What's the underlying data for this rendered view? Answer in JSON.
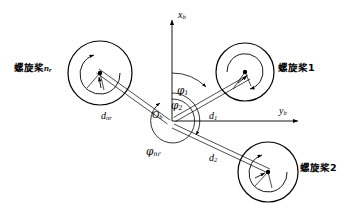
{
  "figure": {
    "type": "multirotor-geometry-diagram",
    "background": "#ffffff",
    "stroke_color": "#000000",
    "width": 356,
    "height": 216
  },
  "axes": {
    "x_axis": {
      "label_main": "x",
      "label_sub": "b",
      "direction": "up",
      "origin_px": [
        172,
        121
      ],
      "tip_px": [
        172,
        18
      ]
    },
    "y_axis": {
      "label_main": "y",
      "label_sub": "b",
      "direction": "right",
      "origin_px": [
        172,
        121
      ],
      "tip_px": [
        300,
        121
      ]
    },
    "origin": {
      "label_main": "O",
      "label_sub": "b"
    }
  },
  "rotors": [
    {
      "id": "rotor-1",
      "label_cjk": "螺旋桨",
      "label_index": "1",
      "center_px": [
        245,
        72
      ],
      "outer_radius": 29,
      "inner_radius": 18,
      "spin": "ccw",
      "arm_label_main": "d",
      "arm_label_sub": "1"
    },
    {
      "id": "rotor-2",
      "label_cjk": "螺旋桨",
      "label_index": "2",
      "center_px": [
        268,
        172
      ],
      "outer_radius": 30,
      "inner_radius": 19,
      "spin": "cw",
      "arm_label_main": "d",
      "arm_label_sub": "2"
    },
    {
      "id": "rotor-nr",
      "label_cjk": "螺旋桨",
      "label_index": "n",
      "label_index_sub": "r",
      "center_px": [
        100,
        73
      ],
      "outer_radius": 32,
      "inner_radius": 20,
      "spin": "cw",
      "arm_label_main": "d",
      "arm_label_sub": "nr"
    }
  ],
  "angles": [
    {
      "id": "phi-1",
      "symbol": "φ",
      "sub": "1",
      "from_axis": "x_b",
      "to": "rotor-1-arm"
    },
    {
      "id": "phi-2",
      "symbol": "φ",
      "sub": "2",
      "from_axis": "x_b",
      "to": "rotor-2-arm"
    },
    {
      "id": "phi-nr",
      "symbol": "φ",
      "sub": "nr",
      "from_axis": "x_b",
      "to": "rotor-nr-arm"
    }
  ],
  "labels": {
    "rotor1_text": "螺旋桨1",
    "rotor2_text": "螺旋桨2",
    "rotornr_cjk": "螺旋桨",
    "rotornr_n": "n",
    "rotornr_r": "r",
    "x_axis_main": "x",
    "x_axis_sub": "b",
    "y_axis_main": "y",
    "y_axis_sub": "b",
    "origin_main": "O",
    "origin_sub": "b",
    "d1_main": "d",
    "d1_sub": "1",
    "d2_main": "d",
    "d2_sub": "2",
    "dnr_main": "d",
    "dnr_sub": "nr",
    "phi1_main": "φ",
    "phi1_sub": "1",
    "phi2_main": "φ",
    "phi2_sub": "2",
    "phinr_main": "φ",
    "phinr_sub": "nr"
  }
}
